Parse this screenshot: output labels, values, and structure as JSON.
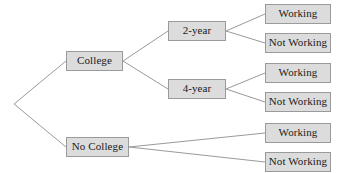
{
  "diagram": {
    "type": "tree-diagram",
    "title": "",
    "colors": {
      "background": "#ffffff",
      "node_fill": "#dcdcdc",
      "node_border": "#9a9a9a",
      "edge": "#9a9a9a",
      "text": "#1a1a1a"
    },
    "root": {
      "name": "root-vertex",
      "x": 14,
      "y": 104
    },
    "nodes": [
      {
        "id": "college",
        "label": "College",
        "x": 66,
        "y": 51,
        "w": 57,
        "h": 20
      },
      {
        "id": "no-college",
        "label": "No College",
        "x": 66,
        "y": 137,
        "w": 63,
        "h": 20
      },
      {
        "id": "two-year",
        "label": "2-year",
        "x": 168,
        "y": 21,
        "w": 58,
        "h": 20
      },
      {
        "id": "four-year",
        "label": "4-year",
        "x": 168,
        "y": 79,
        "w": 58,
        "h": 20
      },
      {
        "id": "working-2year",
        "label": "Working",
        "x": 265,
        "y": 4,
        "w": 66,
        "h": 20
      },
      {
        "id": "not-working-2year",
        "label": "Not Working",
        "x": 265,
        "y": 33,
        "w": 66,
        "h": 20
      },
      {
        "id": "working-4year",
        "label": "Working",
        "x": 265,
        "y": 63,
        "w": 66,
        "h": 20
      },
      {
        "id": "not-working-4year",
        "label": "Not Working",
        "x": 265,
        "y": 92,
        "w": 66,
        "h": 20
      },
      {
        "id": "working-nocollege",
        "label": "Working",
        "x": 265,
        "y": 123,
        "w": 66,
        "h": 20
      },
      {
        "id": "not-working-nocollege",
        "label": "Not Working",
        "x": 265,
        "y": 152,
        "w": 66,
        "h": 20
      }
    ],
    "edges": [
      {
        "id": "root-to-college",
        "from": "root-vertex",
        "to": "college",
        "x1": 14,
        "y1": 104,
        "x2": 66,
        "y2": 61
      },
      {
        "id": "root-to-no-college",
        "from": "root-vertex",
        "to": "no-college",
        "x1": 14,
        "y1": 104,
        "x2": 66,
        "y2": 147
      },
      {
        "id": "college-to-two-year",
        "from": "college",
        "to": "two-year",
        "x1": 123,
        "y1": 61,
        "x2": 168,
        "y2": 31
      },
      {
        "id": "college-to-four-year",
        "from": "college",
        "to": "four-year",
        "x1": 123,
        "y1": 61,
        "x2": 168,
        "y2": 89
      },
      {
        "id": "two-year-to-working",
        "from": "two-year",
        "to": "working-2year",
        "x1": 226,
        "y1": 31,
        "x2": 265,
        "y2": 14
      },
      {
        "id": "two-year-to-not-working",
        "from": "two-year",
        "to": "not-working-2year",
        "x1": 226,
        "y1": 31,
        "x2": 265,
        "y2": 43
      },
      {
        "id": "four-year-to-working",
        "from": "four-year",
        "to": "working-4year",
        "x1": 226,
        "y1": 89,
        "x2": 265,
        "y2": 73
      },
      {
        "id": "four-year-to-not-working",
        "from": "four-year",
        "to": "not-working-4year",
        "x1": 226,
        "y1": 89,
        "x2": 265,
        "y2": 102
      },
      {
        "id": "no-college-to-working",
        "from": "no-college",
        "to": "working-nocollege",
        "x1": 129,
        "y1": 147,
        "x2": 265,
        "y2": 133
      },
      {
        "id": "no-college-to-not-working",
        "from": "no-college",
        "to": "not-working-nocollege",
        "x1": 129,
        "y1": 147,
        "x2": 265,
        "y2": 162
      }
    ]
  }
}
